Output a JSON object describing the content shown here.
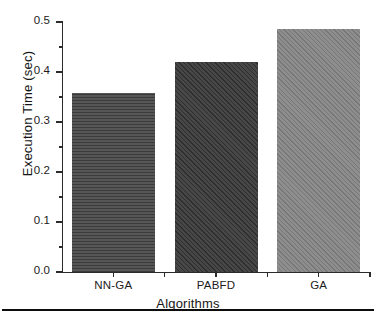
{
  "chart_data": {
    "type": "bar",
    "title": "",
    "subtitle": "",
    "xlabel": "Algorithms",
    "ylabel": "Execution Time (sec)",
    "categories": [
      "NN-GA",
      "PABFD",
      "GA"
    ],
    "values": [
      0.358,
      0.42,
      0.487
    ],
    "series": [
      {
        "name": "Execution Time (sec)",
        "values": [
          0.358,
          0.42,
          0.487
        ]
      }
    ],
    "ylim": [
      0.0,
      0.5
    ],
    "yticks": [
      0.0,
      0.1,
      0.2,
      0.3,
      0.4,
      0.5
    ],
    "ytick_labels": [
      "0.0",
      "0.1",
      "0.2",
      "0.3",
      "0.4",
      "0.5"
    ],
    "y_minor_ticks": [
      0.05,
      0.15,
      0.25,
      0.35,
      0.45
    ],
    "grid": false,
    "legend": "none",
    "legend_position": "none",
    "annotations": [],
    "bar_styles": [
      {
        "category": "NN-GA",
        "fill": "#565656",
        "hatch": "horizontal-lines",
        "hatch_color": "#3b3b3b"
      },
      {
        "category": "PABFD",
        "fill": "#474747",
        "hatch": "diagonal-lines",
        "hatch_color": "#2e2e2e"
      },
      {
        "category": "GA",
        "fill": "#8e8e8e",
        "hatch": "diagonal-lines",
        "hatch_color": "#777777"
      }
    ],
    "axis_color": "#2b2b2b",
    "background_color": "#ffffff"
  },
  "figure": {
    "caption_rule_color": "#0d0d0d"
  }
}
